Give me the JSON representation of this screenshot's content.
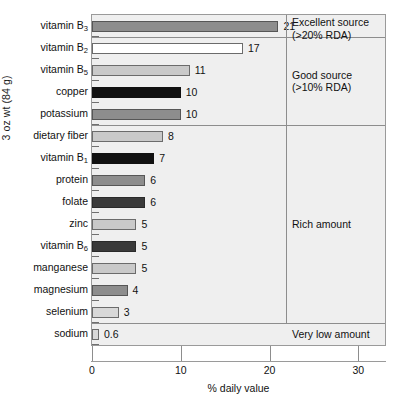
{
  "chart_data": {
    "type": "bar",
    "orientation": "horizontal",
    "title": "",
    "xlabel": "% daily value",
    "ylabel": "3 oz wt (84 g)",
    "xlim": [
      0,
      33
    ],
    "xticks": [
      0,
      10,
      20,
      30
    ],
    "xtick_labels": [
      "0",
      "10",
      "20",
      "30"
    ],
    "grid": false,
    "legend": "none",
    "categories": [
      "vitamin B3",
      "vitamin B2",
      "vitamin B5",
      "copper",
      "potassium",
      "dietary fiber",
      "vitamin B1",
      "protein",
      "folate",
      "zinc",
      "vitamin B6",
      "manganese",
      "magnesium",
      "selenium",
      "sodium"
    ],
    "values": [
      21,
      17,
      11,
      10,
      10,
      8,
      7,
      6,
      6,
      5,
      5,
      5,
      4,
      3,
      0.6
    ],
    "value_labels": [
      "21",
      "17",
      "11",
      "10",
      "10",
      "8",
      "7",
      "6",
      "6",
      "5",
      "5",
      "5",
      "4",
      "3",
      "0.6"
    ],
    "bars": [
      {
        "label": "vitamin B",
        "sub": "3",
        "value": 21,
        "value_label": "21",
        "shade": "shade-mid"
      },
      {
        "label": "vitamin B",
        "sub": "2",
        "value": 17,
        "value_label": "17",
        "shade": "shade-white"
      },
      {
        "label": "vitamin B",
        "sub": "5",
        "value": 11,
        "value_label": "11",
        "shade": "shade-light"
      },
      {
        "label": "copper",
        "sub": "",
        "value": 10,
        "value_label": "10",
        "shade": "shade-black"
      },
      {
        "label": "potassium",
        "sub": "",
        "value": 10,
        "value_label": "10",
        "shade": "shade-mid"
      },
      {
        "label": "dietary fiber",
        "sub": "",
        "value": 8,
        "value_label": "8",
        "shade": "shade-light"
      },
      {
        "label": "vitamin B",
        "sub": "1",
        "value": 7,
        "value_label": "7",
        "shade": "shade-black"
      },
      {
        "label": "protein",
        "sub": "",
        "value": 6,
        "value_label": "6",
        "shade": "shade-mid"
      },
      {
        "label": "folate",
        "sub": "",
        "value": 6,
        "value_label": "6",
        "shade": "shade-dark"
      },
      {
        "label": "zinc",
        "sub": "",
        "value": 5,
        "value_label": "5",
        "shade": "shade-light"
      },
      {
        "label": "vitamin B",
        "sub": "6",
        "value": 5,
        "value_label": "5",
        "shade": "shade-dark"
      },
      {
        "label": "manganese",
        "sub": "",
        "value": 5,
        "value_label": "5",
        "shade": "shade-light"
      },
      {
        "label": "magnesium",
        "sub": "",
        "value": 4,
        "value_label": "4",
        "shade": "shade-mid"
      },
      {
        "label": "selenium",
        "sub": "",
        "value": 3,
        "value_label": "3",
        "shade": "shade-lighter"
      },
      {
        "label": "sodium",
        "sub": "",
        "value": 0.6,
        "value_label": "0.6",
        "shade": "shade-lighter"
      }
    ],
    "annotations": [
      {
        "text": "Excellent source\n(>20% RDA)",
        "covers": [
          "vitamin B3"
        ]
      },
      {
        "text": "Good source\n(>10% RDA)",
        "covers": [
          "vitamin B2",
          "vitamin B5",
          "copper",
          "potassium"
        ]
      },
      {
        "text": "Rich amount",
        "covers": [
          "dietary fiber",
          "vitamin B1",
          "protein",
          "folate",
          "zinc",
          "vitamin B6",
          "manganese",
          "magnesium",
          "selenium"
        ]
      },
      {
        "text": "Very low amount",
        "covers": [
          "sodium"
        ]
      }
    ],
    "colors": {
      "plot_background": "#efefef",
      "page_background": "#ffffff",
      "axis": "#9a9a9a",
      "text": "#111111",
      "bar_mid": "#8d8d8d",
      "bar_white": "#ffffff",
      "bar_light": "#c9c9c9",
      "bar_lighter": "#d8d8d8",
      "bar_dark": "#3a3a3a",
      "bar_black": "#111111"
    }
  }
}
